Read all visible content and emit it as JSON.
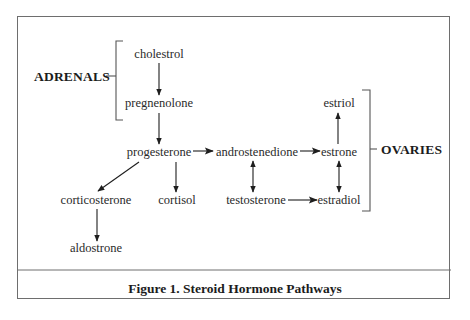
{
  "figure": {
    "caption": "Figure 1. Steroid Hormone Pathways"
  },
  "regions": {
    "adrenals": "ADRENALS",
    "ovaries": "OVARIES"
  },
  "nodes": {
    "cholestrol": "cholestrol",
    "pregnenolone": "pregnenolone",
    "progesterone": "progesterone",
    "androstenedione": "androstenedione",
    "estrone": "estrone",
    "estriol": "estriol",
    "testosterone": "testosterone",
    "estradiol": "estradiol",
    "corticosterone": "corticosterone",
    "cortisol": "cortisol",
    "aldostrone": "aldostrone"
  },
  "edges": [
    {
      "from": "cholestrol",
      "to": "pregnenolone",
      "type": "one-way"
    },
    {
      "from": "pregnenolone",
      "to": "progesterone",
      "type": "one-way"
    },
    {
      "from": "progesterone",
      "to": "androstenedione",
      "type": "one-way"
    },
    {
      "from": "androstenedione",
      "to": "estrone",
      "type": "one-way"
    },
    {
      "from": "estrone",
      "to": "estriol",
      "type": "one-way"
    },
    {
      "from": "androstenedione",
      "to": "testosterone",
      "type": "two-way"
    },
    {
      "from": "estrone",
      "to": "estradiol",
      "type": "two-way"
    },
    {
      "from": "testosterone",
      "to": "estradiol",
      "type": "one-way"
    },
    {
      "from": "progesterone",
      "to": "corticosterone",
      "type": "one-way"
    },
    {
      "from": "progesterone",
      "to": "cortisol",
      "type": "one-way"
    },
    {
      "from": "corticosterone",
      "to": "aldostrone",
      "type": "one-way"
    }
  ],
  "groups": [
    {
      "label": "ADRENALS",
      "members": [
        "cholestrol",
        "pregnenolone"
      ]
    },
    {
      "label": "OVARIES",
      "members": [
        "estriol",
        "estrone",
        "estradiol"
      ]
    }
  ]
}
